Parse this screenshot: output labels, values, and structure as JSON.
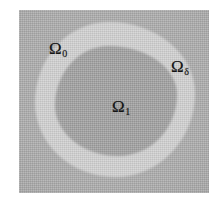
{
  "figure": {
    "colors": {
      "background": "#ffffff",
      "outer_region": "#a8a8a8",
      "middle_shell": "#cfcfcf",
      "inner_region": "#9b9b9b",
      "label_color": "#141414"
    },
    "panel": {
      "x": 19,
      "y": 10,
      "width": 190,
      "height": 183
    }
  },
  "labels": {
    "outer": {
      "symbol": "Ω",
      "subscript": "0"
    },
    "middle": {
      "symbol": "Ω",
      "subscript": "δ"
    },
    "inner": {
      "symbol": "Ω",
      "subscript": "1"
    }
  }
}
